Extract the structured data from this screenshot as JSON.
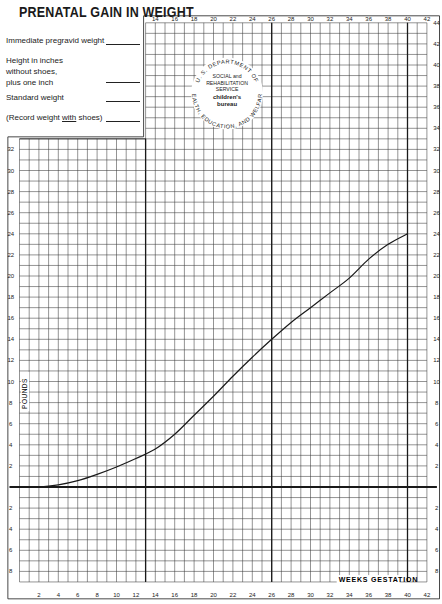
{
  "header": {
    "title": "PRENATAL GAIN IN WEIGHT",
    "fields": [
      {
        "label": "Immediate pregravid weight",
        "value": ""
      },
      {
        "label": "Height in inches\nwithout shoes,\nplus one inch",
        "value": ""
      },
      {
        "label": "Standard weight",
        "value": ""
      },
      {
        "label_prefix": "(Record weight ",
        "label_emph": "with",
        "label_suffix": " shoes)",
        "value": ""
      }
    ]
  },
  "seal": {
    "outer_top": "U. S. DEPARTMENT OF",
    "outer_bottom": "HEALTH, EDUCATION, AND WELFARE",
    "line1": "SOCIAL and",
    "line2": "REHABILITATION",
    "line3": "SERVICE",
    "line4": "children's",
    "line5": "bureau"
  },
  "colors": {
    "grid": "#3a3a3a",
    "grid_light": "#6a6a6a",
    "heavy": "#1a1a1a",
    "curve": "#1a1a1a",
    "paper": "#ffffff"
  },
  "chart_data": {
    "type": "line",
    "title": "PRENATAL GAIN IN WEIGHT",
    "xlabel": "WEEKS GESTATION",
    "ylabel": "POUNDS",
    "xlim": [
      0,
      42
    ],
    "ylim": [
      -9,
      44
    ],
    "grid": true,
    "x_ticks_bottom": [
      2,
      4,
      6,
      8,
      10,
      12,
      14,
      16,
      18,
      20,
      22,
      24,
      26,
      28,
      30,
      32,
      34,
      36,
      38,
      40,
      42
    ],
    "x_ticks_top": [
      14,
      16,
      18,
      20,
      22,
      24,
      26,
      28,
      30,
      32,
      34,
      36,
      38,
      40,
      42
    ],
    "y_ticks_left": [
      32,
      30,
      28,
      26,
      24,
      22,
      20,
      18,
      16,
      14,
      12,
      10,
      8,
      6,
      4,
      2
    ],
    "y_ticks_left_below": [
      2,
      4,
      6,
      8
    ],
    "y_ticks_right": [
      44,
      42,
      40,
      38,
      36,
      34,
      32,
      30,
      28,
      26,
      24,
      22,
      20,
      18,
      16,
      14,
      12,
      10,
      8,
      6,
      4,
      2
    ],
    "y_ticks_right_below": [
      2,
      4,
      6,
      8
    ],
    "reference_lines_weeks": [
      13,
      26,
      40
    ],
    "series": [
      {
        "name": "Normal prenatal weight gain",
        "x": [
          0,
          2,
          4,
          6,
          8,
          10,
          12,
          14,
          16,
          18,
          20,
          22,
          24,
          26,
          28,
          30,
          32,
          34,
          36,
          38,
          40
        ],
        "y": [
          0,
          0,
          0.2,
          0.6,
          1.2,
          1.9,
          2.7,
          3.6,
          5.0,
          6.8,
          8.6,
          10.5,
          12.3,
          14.0,
          15.6,
          17.0,
          18.4,
          19.8,
          21.6,
          23.0,
          24.0
        ]
      }
    ]
  }
}
